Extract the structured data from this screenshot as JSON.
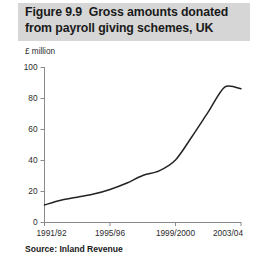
{
  "figure": {
    "title_line_1": "Figure 9.9  Gross amounts donated",
    "title_line_2": "from payroll giving schemes, UK",
    "title_band_color": "#d6d6d6",
    "unit_label": "£ million",
    "source_note": "Source: Inland Revenue",
    "line_color": "#232323",
    "axis_color": "#8a8a8a"
  },
  "chart_data": {
    "type": "line",
    "title": "Figure 9.9  Gross amounts donated from payroll giving schemes, UK",
    "subtitle": "",
    "xlabel": "",
    "ylabel": "£ million",
    "grid": false,
    "legend": "none",
    "ylim": [
      0,
      100
    ],
    "ytick_labels": [
      "0",
      "20",
      "40",
      "60",
      "80",
      "100"
    ],
    "ytick_values": [
      0,
      20,
      40,
      60,
      80,
      100
    ],
    "xtick_labels": [
      "1991/92",
      "1995/96",
      "1999/2000",
      "2003/04"
    ],
    "xtick_values": [
      "1991/92",
      "1995/96",
      "1999/2000",
      "2003/04"
    ],
    "x": [
      "1991/92",
      "1992/93",
      "1993/94",
      "1994/95",
      "1995/96",
      "1996/97",
      "1997/98",
      "1998/99",
      "1999/2000",
      "2000/01",
      "2001/02",
      "2002/03",
      "2003/04"
    ],
    "values": [
      11,
      14,
      16,
      18,
      21,
      25,
      30,
      33,
      40,
      55,
      71,
      87,
      86
    ],
    "series": [
      {
        "name": "Gross amounts donated",
        "values": [
          11,
          14,
          16,
          18,
          21,
          25,
          30,
          33,
          40,
          55,
          71,
          87,
          86
        ]
      }
    ],
    "annotations": [],
    "source": "Inland Revenue"
  }
}
